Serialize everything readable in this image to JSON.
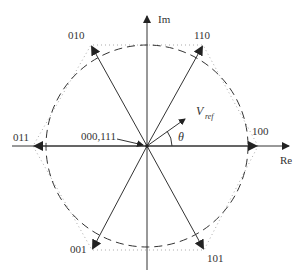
{
  "diagram": {
    "axes": {
      "real_label": "Re",
      "imag_label": "Im"
    },
    "vectors": [
      {
        "label": "100",
        "angle_deg": 0
      },
      {
        "label": "110",
        "angle_deg": 60
      },
      {
        "label": "010",
        "angle_deg": 120
      },
      {
        "label": "011",
        "angle_deg": 180
      },
      {
        "label": "001",
        "angle_deg": 240
      },
      {
        "label": "101",
        "angle_deg": 300
      }
    ],
    "zero_vectors_label": "000,111",
    "reference_vector": {
      "label_main": "V",
      "label_sub": "ref",
      "angle_symbol": "θ"
    },
    "shapes": {
      "inscribed_circle": "dashed",
      "hexagon": "dotted"
    },
    "colors": {
      "line": "#333333",
      "dotted": "#999999",
      "background": "#ffffff"
    }
  }
}
